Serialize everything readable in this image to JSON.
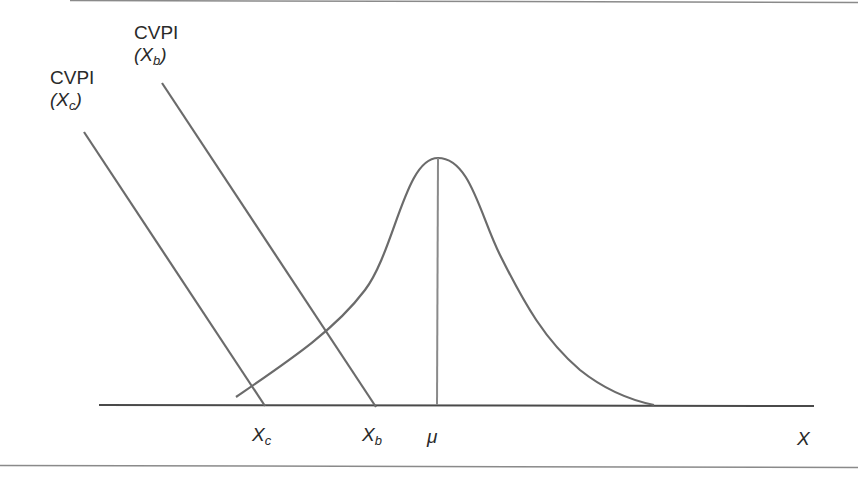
{
  "diagram": {
    "type": "normal-distribution-with-cvpi-lines",
    "colors": {
      "stroke": "#6b6b6b",
      "axis": "#4a4a4a",
      "border": "#8a8a8a",
      "text": "#2a2a2a",
      "background": "#ffffff"
    },
    "cvpi_lines": [
      {
        "id": "cvpi-xc",
        "title": "CVPI",
        "arg_open": "(",
        "arg_var": "X",
        "arg_sub": "c",
        "arg_close": ")",
        "x1": 84,
        "y1": 132,
        "x2": 265,
        "y2": 406
      },
      {
        "id": "cvpi-xb",
        "title": "CVPI",
        "arg_open": "(",
        "arg_var": "X",
        "arg_sub": "b",
        "arg_close": ")",
        "x1": 162,
        "y1": 83,
        "x2": 376,
        "y2": 407
      }
    ],
    "axis": {
      "x1": 99,
      "y1": 405,
      "x2": 814,
      "y2": 406,
      "label": "X"
    },
    "tick_labels": [
      {
        "id": "xc",
        "var": "X",
        "sub": "c"
      },
      {
        "id": "xb",
        "var": "X",
        "sub": "b"
      },
      {
        "id": "mu",
        "var": "μ",
        "sub": ""
      }
    ],
    "mean_line": {
      "x": 437,
      "y_top": 158,
      "y_bottom": 405,
      "label": "μ"
    },
    "bell_curve": {
      "start": [
        236,
        397
      ],
      "peak": [
        438,
        158
      ],
      "end": [
        654,
        405
      ]
    }
  }
}
